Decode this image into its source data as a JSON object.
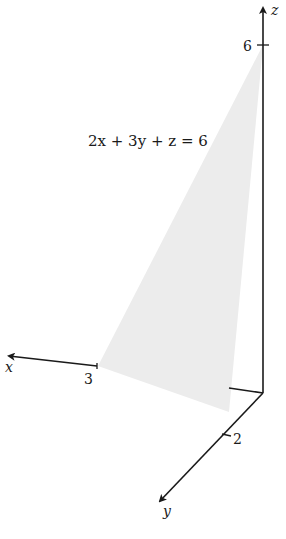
{
  "figure": {
    "equation": "2x + 3y + z = 6",
    "plane_color": "#ececec",
    "axis_color": "#1a1a1a",
    "axes": {
      "x": {
        "label": "x",
        "tick_label": "3"
      },
      "y": {
        "label": "y",
        "tick_label": "2"
      },
      "z": {
        "label": "z",
        "tick_label": "6"
      }
    },
    "intercepts": [
      {
        "axis": "x",
        "value": 3
      },
      {
        "axis": "y",
        "value": 2
      },
      {
        "axis": "z",
        "value": 6
      }
    ]
  }
}
